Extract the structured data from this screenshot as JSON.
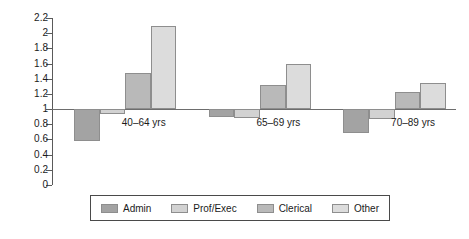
{
  "chart_data": {
    "type": "bar",
    "title": "",
    "subtitle": "",
    "xlabel": "",
    "ylabel": "",
    "categories": [
      "40–64 yrs",
      "65–69 yrs",
      "70–89 yrs"
    ],
    "series": [
      {
        "name": "Admin",
        "color": "#a3a3a3",
        "values": [
          0.58,
          0.9,
          0.68
        ]
      },
      {
        "name": "Prof/Exec",
        "color": "#d2d2d2",
        "values": [
          0.93,
          0.88,
          0.87
        ]
      },
      {
        "name": "Clerical",
        "color": "#b9b9b9",
        "values": [
          1.47,
          1.32,
          1.22
        ]
      },
      {
        "name": "Other",
        "color": "#dcdcdc",
        "values": [
          2.1,
          1.59,
          1.35
        ]
      }
    ],
    "ylim": [
      0,
      2.2
    ],
    "ytick_step": 0.2,
    "ytick_labels": [
      "2.2",
      "2",
      "1.8",
      "1.6",
      "1.4",
      "1.2",
      "1",
      "0.8",
      "0.6",
      "0.4",
      "0.2",
      "0"
    ],
    "ytick_values": [
      2.2,
      2,
      1.8,
      1.6,
      1.4,
      1.2,
      1,
      0.8,
      0.6,
      0.4,
      0.2,
      0
    ],
    "reference_line": 1,
    "grid": false,
    "legend_position": "bottom",
    "legend_entries": [
      "Admin",
      "Prof/Exec",
      "Clerical",
      "Other"
    ],
    "bar_border_color": "#8e8e8e",
    "axis_color": "#5a5a5a",
    "baseline_color": "#6d6d6d"
  }
}
